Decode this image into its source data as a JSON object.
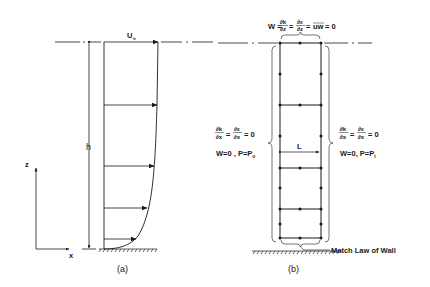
{
  "panel_a": {
    "caption": "(a)",
    "freestream_label": "U",
    "freestream_subscript": "∞",
    "height_label": "h",
    "axis_z_label": "z",
    "axis_x_label": "x"
  },
  "panel_b": {
    "caption": "(b)",
    "top_bc": {
      "lhs": "W =",
      "frac1_num": "∂k",
      "frac1_den": "∂z",
      "eq1": "=",
      "frac2_num": "∂ε",
      "frac2_den": "∂z",
      "eq2": "=",
      "overline": "uw",
      "tail": "= 0"
    },
    "left_bc": {
      "frac1_num": "∂k",
      "frac1_den": "∂x",
      "eq1": "=",
      "frac2_num": "∂ε",
      "frac2_den": "∂x",
      "tail": "= 0",
      "line2": "W=0 , P=P",
      "line2_sub": "o"
    },
    "right_bc": {
      "frac1_num": "∂k",
      "frac1_den": "∂x",
      "eq1": "=",
      "frac2_num": "∂ε",
      "frac2_den": "∂x",
      "tail": "= 0",
      "line2": "W=0,  P=P",
      "line2_sub": "i"
    },
    "width_label": "L",
    "wall_label": "Match Law of Wall"
  },
  "colors": {
    "ink": "#1a1a1a",
    "background": "#ffffff"
  }
}
